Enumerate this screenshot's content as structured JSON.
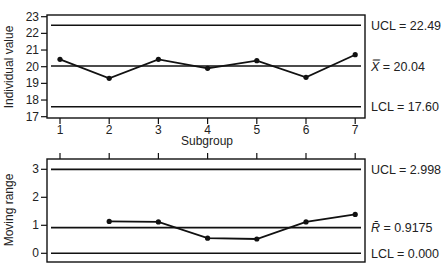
{
  "chart_data": [
    {
      "type": "line",
      "title": "",
      "xlabel": "Subgroup",
      "ylabel": "Individual value",
      "x": [
        1,
        2,
        3,
        4,
        5,
        6,
        7
      ],
      "x_tick_labels": [
        "1",
        "2",
        "3",
        "4",
        "5",
        "6",
        "7"
      ],
      "y_ticks": [
        17,
        18,
        19,
        20,
        21,
        22,
        23
      ],
      "ylim": [
        17,
        23
      ],
      "series": [
        {
          "name": "Individual value",
          "values": [
            20.44,
            19.3,
            20.44,
            19.9,
            20.36,
            19.36,
            20.72
          ]
        }
      ],
      "control_lines": [
        {
          "name": "UCL",
          "value": 22.49,
          "label": "UCL = 22.49"
        },
        {
          "name": "Center",
          "value": 20.04,
          "label_symbol": "X̿",
          "label_value": " = 20.04"
        },
        {
          "name": "LCL",
          "value": 17.6,
          "label": "LCL = 17.60"
        }
      ],
      "grid": false,
      "legend": "none"
    },
    {
      "type": "line",
      "title": "",
      "xlabel": "",
      "ylabel": "Moving range",
      "x": [
        2,
        3,
        4,
        5,
        6,
        7
      ],
      "y_ticks": [
        0,
        1,
        2,
        3
      ],
      "ylim": [
        -0.3,
        3.3
      ],
      "series": [
        {
          "name": "Moving range",
          "values": [
            1.14,
            1.12,
            0.54,
            0.51,
            1.12,
            1.39
          ]
        }
      ],
      "control_lines": [
        {
          "name": "UCL",
          "value": 2.998,
          "label": "UCL = 2.998"
        },
        {
          "name": "Center",
          "value": 0.9175,
          "label_symbol": "R̄",
          "label_value": " = 0.9175"
        },
        {
          "name": "LCL",
          "value": 0.0,
          "label": "LCL = 0.000"
        }
      ],
      "grid": false,
      "legend": "none"
    }
  ]
}
